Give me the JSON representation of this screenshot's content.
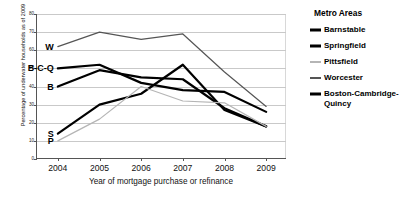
{
  "chart_data": {
    "type": "line",
    "title": "",
    "xlabel": "Year of mortgage purchase or refinance",
    "ylabel": "Percentage of underwater households as of 2009",
    "categories": [
      "2004",
      "2005",
      "2006",
      "2007",
      "2008",
      "2009"
    ],
    "x": [
      2004,
      2005,
      2006,
      2007,
      2008,
      2009
    ],
    "ylim": [
      0,
      80
    ],
    "yticks": [
      "0",
      "10",
      "20",
      "30",
      "40",
      "50",
      "60",
      "70",
      "80"
    ],
    "ytick_values": [
      0,
      10,
      20,
      30,
      40,
      50,
      60,
      70,
      80
    ],
    "grid": true,
    "legend_position": "right",
    "legend_title": "Metro Areas",
    "series": [
      {
        "name": "Barnstable",
        "short_label": "B",
        "color": "#000000",
        "width": 2.2,
        "values": [
          40,
          49,
          45,
          44,
          28,
          18
        ]
      },
      {
        "name": "Springfield",
        "short_label": "S",
        "color": "#000000",
        "width": 2.2,
        "values": [
          14,
          30,
          36,
          52,
          27,
          18
        ]
      },
      {
        "name": "Pittsfield",
        "short_label": "P",
        "color": "#b5b5b5",
        "width": 1.2,
        "values": [
          10,
          22,
          40,
          32,
          31,
          18
        ]
      },
      {
        "name": "Worcester",
        "short_label": "W",
        "color": "#555555",
        "width": 1.2,
        "values": [
          62,
          70,
          66,
          69,
          48,
          29
        ]
      },
      {
        "name": "Boston-Cambridge-Quincy",
        "short_label": "B-C-Q",
        "color": "#000000",
        "width": 2.2,
        "values": [
          50,
          52,
          42,
          38,
          37,
          26
        ]
      }
    ]
  },
  "legend": {
    "title": "Metro Areas",
    "items": [
      {
        "label": "Barnstable",
        "color": "#000000",
        "thickness": 3
      },
      {
        "label": "Springfield",
        "color": "#000000",
        "thickness": 3
      },
      {
        "label": "Pittsfield",
        "color": "#b5b5b5",
        "thickness": 2
      },
      {
        "label": "Worcester",
        "color": "#555555",
        "thickness": 2
      },
      {
        "label": "Boston-Cambridge-Quincy",
        "color": "#000000",
        "thickness": 3
      }
    ]
  }
}
